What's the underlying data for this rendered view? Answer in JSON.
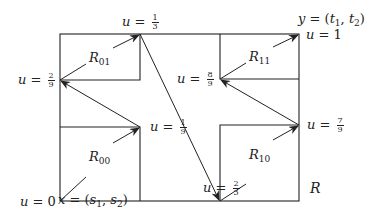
{
  "diagram": {
    "title": "",
    "outer_region_label": "R",
    "start_point_label": "x = (s1, s2)",
    "end_point_label": "y = (t1, t2)",
    "subregions": [
      {
        "id": "R00",
        "label": "R",
        "sub": "00"
      },
      {
        "id": "R01",
        "label": "R",
        "sub": "01"
      },
      {
        "id": "R10",
        "label": "R",
        "sub": "10"
      },
      {
        "id": "R11",
        "label": "R",
        "sub": "11"
      }
    ],
    "parameter_points": [
      {
        "name": "u0",
        "var": "u",
        "eq": "=",
        "value": "0"
      },
      {
        "name": "u1_9",
        "var": "u",
        "eq": "=",
        "num": "1",
        "den": "9"
      },
      {
        "name": "u2_9",
        "var": "u",
        "eq": "=",
        "num": "2",
        "den": "9"
      },
      {
        "name": "u1_3",
        "var": "u",
        "eq": "=",
        "num": "1",
        "den": "3"
      },
      {
        "name": "u2_3",
        "var": "u",
        "eq": "=",
        "num": "2",
        "den": "3"
      },
      {
        "name": "u7_9",
        "var": "u",
        "eq": "=",
        "num": "7",
        "den": "9"
      },
      {
        "name": "u8_9",
        "var": "u",
        "eq": "=",
        "num": "8",
        "den": "9"
      },
      {
        "name": "u1",
        "var": "u",
        "eq": "=",
        "value": "1"
      }
    ],
    "x_label": {
      "var": "x",
      "eq": "=",
      "open": "(",
      "a": "s",
      "a_sub": "1",
      "comma": ",",
      "b": "s",
      "b_sub": "2",
      "close": ")"
    },
    "y_label": {
      "var": "y",
      "eq": "=",
      "open": "(",
      "a": "t",
      "a_sub": "1",
      "comma": ",",
      "b": "t",
      "b_sub": "2",
      "close": ")"
    },
    "colors": {
      "stroke": "#222222",
      "background": "#ffffff"
    }
  }
}
